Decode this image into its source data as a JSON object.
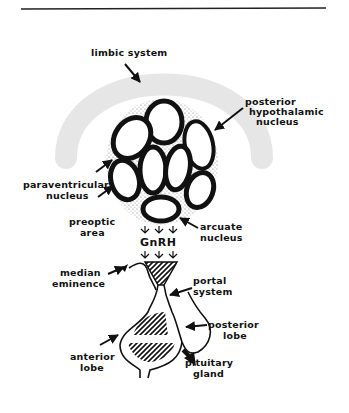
{
  "figure": {
    "colors": {
      "ink": "#111111",
      "limbic_band": "#e6e6e6",
      "stipple": "#8a8a8a",
      "background": "#ffffff"
    }
  },
  "labels": {
    "limbic_system": "limbic system",
    "posterior_hypothalamic_nucleus": [
      "posterior",
      "hypothalamic",
      "nucleus"
    ],
    "paraventricular_nucleus": [
      "paraventricular",
      "nucleus"
    ],
    "preoptic_area": [
      "preoptic",
      "area"
    ],
    "arcuate_nucleus": [
      "arcuate",
      "nucleus"
    ],
    "gnrh": "GnRH",
    "median_eminence": [
      "median",
      "eminence"
    ],
    "portal_system": [
      "portal",
      "system"
    ],
    "posterior_lobe": [
      "posterior",
      "lobe"
    ],
    "anterior_lobe": [
      "anterior",
      "lobe"
    ],
    "pituitary_gland": [
      "pituitary",
      "gland"
    ]
  }
}
